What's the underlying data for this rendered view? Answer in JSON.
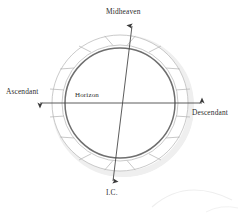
{
  "diagram": {
    "labels": {
      "midheaven": "Midheaven",
      "ascendant": "Ascendant",
      "descendant": "Descendant",
      "ic": "I.C.",
      "horizon": "Horizon"
    },
    "colors": {
      "background": "#ffffff",
      "inner_circle_stroke": "#6f6f6f",
      "outer_ring_stroke": "#b5b5b5",
      "segment_divider": "#a8a8a8",
      "axis_line": "#5a5a5a",
      "text": "#2e2e2e",
      "shadow": "#e3e3e3",
      "faint_arc": "#ececec"
    },
    "geometry": {
      "center_x": 120,
      "center_y": 103,
      "outer_radius": 68,
      "ring_inner_radius": 58,
      "inner_circle_radius": 55,
      "segment_count": 12,
      "segment_span_degrees": 30,
      "vertical_axis_tilt_degrees": 7
    },
    "axes": [
      {
        "name": "horizon-axis",
        "from_label": "Ascendant",
        "to_label": "Descendant",
        "orientation": "horizontal",
        "arrows": "both"
      },
      {
        "name": "meridian-axis",
        "from_label": "Midheaven",
        "to_label": "I.C.",
        "orientation": "vertical-tilted",
        "arrows": "both"
      }
    ]
  }
}
